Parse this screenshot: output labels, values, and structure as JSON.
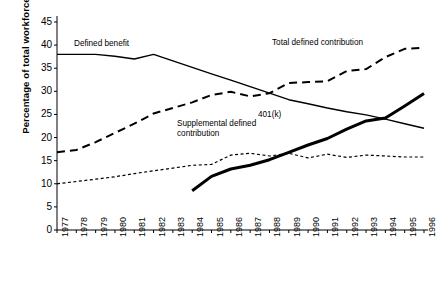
{
  "chart_data": {
    "type": "line",
    "title": "",
    "xlabel": "",
    "ylabel": "Percentage of total workforce",
    "ylim": [
      0,
      45
    ],
    "ytick_step": 5,
    "yticks": [
      "45",
      "40",
      "35",
      "30",
      "25",
      "20",
      "15",
      "10",
      "5",
      "0"
    ],
    "grid": false,
    "legend_position": "inline-annotations",
    "x": [
      "1977",
      "1978",
      "1979",
      "1980",
      "1981",
      "1982",
      "1983",
      "1984",
      "1985",
      "1986",
      "1987",
      "1988",
      "1989",
      "1990",
      "1991",
      "1992",
      "1993",
      "1994",
      "1995",
      "1996"
    ],
    "series": [
      {
        "name": "Defined benefit",
        "style": "solid-thin",
        "color": "#000000",
        "values": [
          38.0,
          38.0,
          38.0,
          37.6,
          37.0,
          38.0,
          36.6,
          35.2,
          33.8,
          32.4,
          31.0,
          29.6,
          28.2,
          27.3,
          26.4,
          25.6,
          24.9,
          24.0,
          23.0,
          22.0
        ]
      },
      {
        "name": "Total defined contribution",
        "style": "dashed-bold",
        "color": "#000000",
        "values": [
          16.8,
          17.3,
          19.0,
          21.0,
          23.0,
          25.2,
          26.4,
          27.6,
          29.2,
          29.9,
          28.9,
          29.6,
          31.8,
          32.0,
          32.2,
          34.4,
          34.8,
          37.4,
          39.2,
          39.4
        ]
      },
      {
        "name": "Supplemental defined contribution",
        "style": "dotted-thin",
        "color": "#000000",
        "values": [
          10.0,
          10.5,
          11.0,
          11.5,
          12.2,
          12.8,
          13.4,
          14.0,
          14.2,
          16.2,
          16.6,
          16.0,
          16.6,
          15.6,
          16.4,
          15.7,
          16.2,
          16.0,
          15.8,
          15.8
        ]
      },
      {
        "name": "401(k)",
        "style": "solid-thick",
        "color": "#000000",
        "values": [
          null,
          null,
          null,
          null,
          null,
          null,
          null,
          8.5,
          11.6,
          13.2,
          14.0,
          15.2,
          16.8,
          18.4,
          19.8,
          21.8,
          23.6,
          24.2,
          26.8,
          29.5
        ]
      }
    ],
    "annotations": [
      {
        "id": "defined-benefit",
        "text": "Defined benefit",
        "lines": [
          "Defined benefit"
        ]
      },
      {
        "id": "total-defined-contribution",
        "text": "Total defined contribution",
        "lines": [
          "Total defined contribution"
        ]
      },
      {
        "id": "supplemental-defined-contribution",
        "text": "Supplemental defined contribution",
        "lines": [
          "Supplemental defined",
          "contribution"
        ]
      },
      {
        "id": "four-oh-one-k",
        "text": "401(k)",
        "lines": [
          "401(k)"
        ]
      }
    ]
  }
}
